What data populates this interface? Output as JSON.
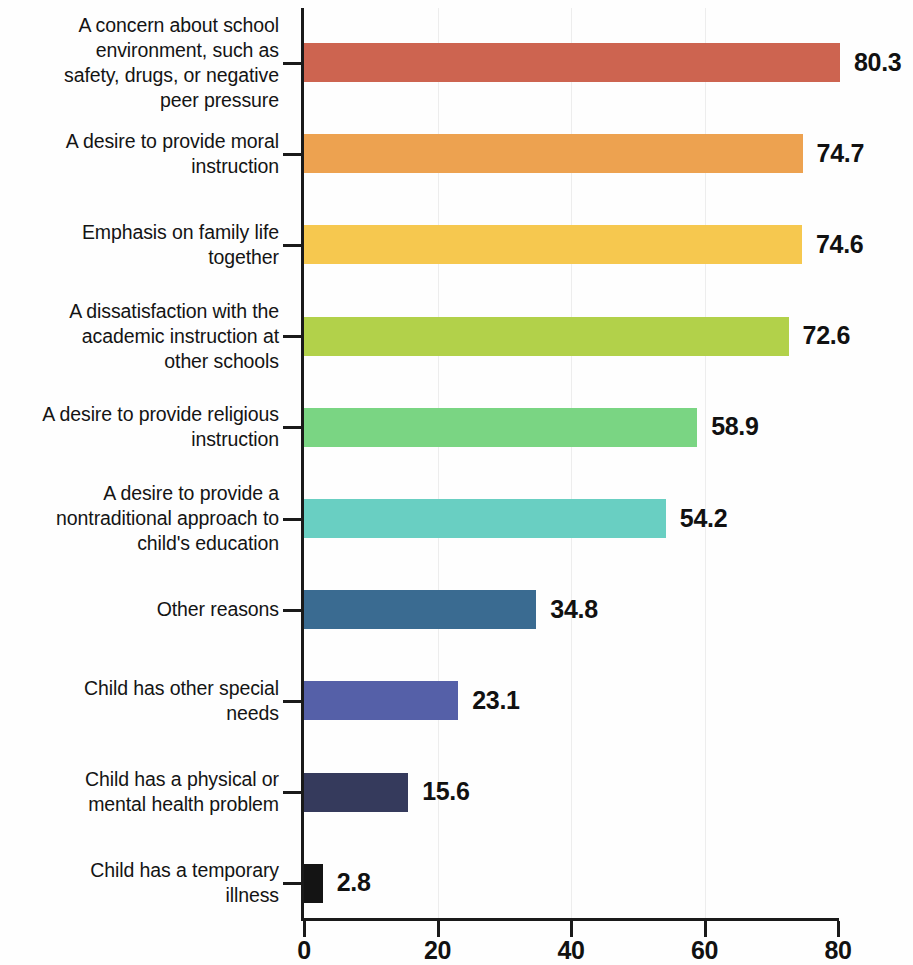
{
  "chart_data": {
    "type": "bar",
    "orientation": "horizontal",
    "title": "",
    "xlabel": "",
    "ylabel": "",
    "xlim": [
      0,
      80
    ],
    "xticks": [
      0,
      20,
      40,
      60,
      80
    ],
    "xtick_labels": [
      "0",
      "20",
      "40",
      "60",
      "80"
    ],
    "grid": true,
    "grid_axis": "x",
    "legend": "none",
    "value_label_format": "one-decimal",
    "categories": [
      "A concern about school environment, such as safety, drugs, or negative peer pressure",
      "A desire to provide moral instruction",
      "Emphasis on family life together",
      "A dissatisfaction with the academic instruction at other schools",
      "A desire to provide religious instruction",
      "A desire to provide a nontraditional approach to child's education",
      "Other reasons",
      "Child has other special needs",
      "Child has a physical or mental health problem",
      "Child has a temporary illness"
    ],
    "values": [
      80.3,
      74.7,
      74.6,
      72.6,
      58.9,
      54.2,
      34.8,
      23.1,
      15.6,
      2.8
    ],
    "value_labels": [
      "80.3",
      "74.7",
      "74.6",
      "72.6",
      "58.9",
      "54.2",
      "34.8",
      "23.1",
      "15.6",
      "2.8"
    ],
    "colors": [
      "#cd6450",
      "#eda250",
      "#f6c84f",
      "#b2d14a",
      "#7ad583",
      "#69cfc2",
      "#3a6b91",
      "#5560a8",
      "#353a5c",
      "#141414"
    ],
    "bars": [
      {
        "label_lines": [
          "A concern about school",
          "environment, such as",
          "safety, drugs, or negative",
          "peer pressure"
        ],
        "value": 80.3,
        "value_label": "80.3",
        "color": "#cd6450"
      },
      {
        "label_lines": [
          "A desire to provide moral",
          "instruction"
        ],
        "value": 74.7,
        "value_label": "74.7",
        "color": "#eda250"
      },
      {
        "label_lines": [
          "Emphasis on family life",
          "together"
        ],
        "value": 74.6,
        "value_label": "74.6",
        "color": "#f6c84f"
      },
      {
        "label_lines": [
          "A dissatisfaction with the",
          "academic instruction at",
          "other schools"
        ],
        "value": 72.6,
        "value_label": "72.6",
        "color": "#b2d14a"
      },
      {
        "label_lines": [
          "A desire to provide religious",
          "instruction"
        ],
        "value": 58.9,
        "value_label": "58.9",
        "color": "#7ad583"
      },
      {
        "label_lines": [
          "A desire to provide a",
          "nontraditional approach to",
          "child's education"
        ],
        "value": 54.2,
        "value_label": "54.2",
        "color": "#69cfc2"
      },
      {
        "label_lines": [
          "Other reasons"
        ],
        "value": 34.8,
        "value_label": "34.8",
        "color": "#3a6b91"
      },
      {
        "label_lines": [
          "Child has other special",
          "needs"
        ],
        "value": 23.1,
        "value_label": "23.1",
        "color": "#5560a8"
      },
      {
        "label_lines": [
          "Child has a physical or",
          "mental health problem"
        ],
        "value": 15.6,
        "value_label": "15.6",
        "color": "#353a5c"
      },
      {
        "label_lines": [
          "Child has a temporary",
          "illness"
        ],
        "value": 2.8,
        "value_label": "2.8",
        "color": "#141414"
      }
    ]
  }
}
